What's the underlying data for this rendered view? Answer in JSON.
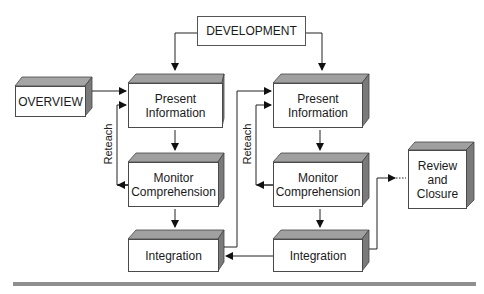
{
  "diagram": {
    "nodes": {
      "development": "DEVELOPMENT",
      "overview": "OVERVIEW",
      "present_left_1": "Present",
      "present_left_2": "Information",
      "monitor_left_1": "Monitor",
      "monitor_left_2": "Comprehension",
      "integration_left": "Integration",
      "present_right_1": "Present",
      "present_right_2": "Information",
      "monitor_right_1": "Monitor",
      "monitor_right_2": "Comprehension",
      "integration_right": "Integration",
      "review_1": "Review",
      "review_2": "and",
      "review_3": "Closure"
    },
    "edge_labels": {
      "reteach_left": "Reteach",
      "reteach_right": "Reteach"
    },
    "colors": {
      "box_top": "#9a9a9a",
      "box_side": "#7a7a7a",
      "line": "#222222",
      "bar": "#8f8f8f"
    }
  }
}
